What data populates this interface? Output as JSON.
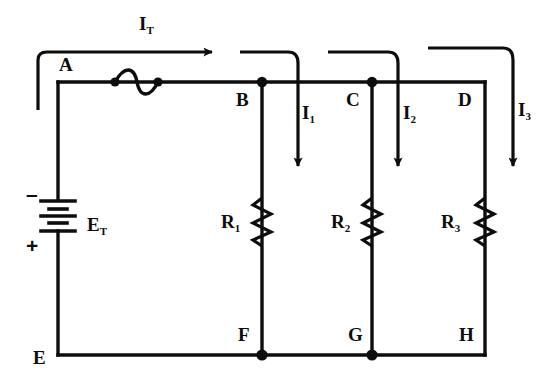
{
  "diagram": {
    "type": "schematic",
    "stroke_color": "#0d0d0d",
    "background_color": "#ffffff"
  },
  "nodes": {
    "a": "A",
    "b": "B",
    "c": "C",
    "d": "D",
    "e": "E",
    "f": "F",
    "g": "G",
    "h": "H"
  },
  "source": {
    "label": "E",
    "sub": "T",
    "negative_sign": "–",
    "positive_sign": "+",
    "symbol": "battery-multicell"
  },
  "components": [
    {
      "label": "R",
      "sub": "1",
      "symbol": "resistor-zigzag"
    },
    {
      "label": "R",
      "sub": "2",
      "symbol": "resistor-zigzag"
    },
    {
      "label": "R",
      "sub": "3",
      "symbol": "resistor-zigzag"
    }
  ],
  "fuse": {
    "symbol": "fuse-wave"
  },
  "currents": [
    {
      "label": "I",
      "sub": "T",
      "direction": "right",
      "role": "total-current"
    },
    {
      "label": "I",
      "sub": "1",
      "direction": "down",
      "role": "branch-current"
    },
    {
      "label": "I",
      "sub": "2",
      "direction": "down",
      "role": "branch-current"
    },
    {
      "label": "I",
      "sub": "3",
      "direction": "down",
      "role": "branch-current"
    }
  ]
}
